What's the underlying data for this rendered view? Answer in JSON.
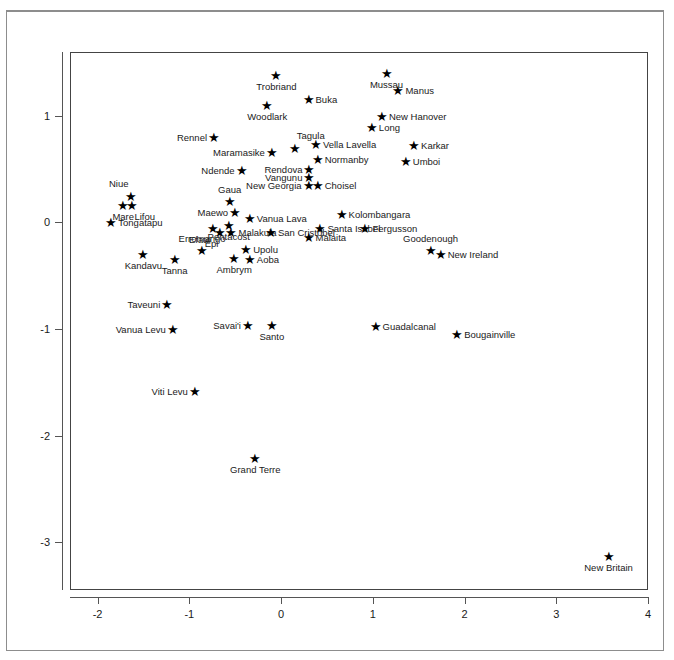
{
  "chart_data": {
    "type": "scatter",
    "title": "",
    "xlabel": "",
    "ylabel": "",
    "xlim": [
      -2.3,
      4.0
    ],
    "ylim": [
      -3.45,
      1.6
    ],
    "xticks": [
      "-2",
      "-1",
      "0",
      "1",
      "2",
      "3",
      "4"
    ],
    "xtick_values": [
      -2,
      -1,
      0,
      1,
      2,
      3,
      4
    ],
    "yticks": [
      "1",
      "0",
      "-1",
      "-2",
      "-3"
    ],
    "ytick_values": [
      1,
      0,
      -1,
      -2,
      -3
    ],
    "grid": false,
    "legend": false,
    "marker": "star",
    "marker_color": "#000000",
    "points": [
      {
        "label": "Trobriand",
        "x": -0.05,
        "y": 1.38,
        "pos": "below"
      },
      {
        "label": "Mussau",
        "x": 1.15,
        "y": 1.4,
        "pos": "below"
      },
      {
        "label": "Manus",
        "x": 1.28,
        "y": 1.24,
        "pos": "right"
      },
      {
        "label": "Woodlark",
        "x": -0.15,
        "y": 1.1,
        "pos": "below"
      },
      {
        "label": "Buka",
        "x": 0.3,
        "y": 1.16,
        "pos": "right"
      },
      {
        "label": "New Hanover",
        "x": 1.1,
        "y": 1.0,
        "pos": "right"
      },
      {
        "label": "Long",
        "x": 0.99,
        "y": 0.9,
        "pos": "right"
      },
      {
        "label": "Rennel",
        "x": -0.73,
        "y": 0.8,
        "pos": "left"
      },
      {
        "label": "Tagula",
        "x": 0.15,
        "y": 0.7,
        "pos": "abover"
      },
      {
        "label": "Vella Lavella",
        "x": 0.38,
        "y": 0.74,
        "pos": "right"
      },
      {
        "label": "Karkar",
        "x": 1.45,
        "y": 0.73,
        "pos": "right"
      },
      {
        "label": "Maramasike",
        "x": -0.1,
        "y": 0.66,
        "pos": "left"
      },
      {
        "label": "Normanby",
        "x": 0.4,
        "y": 0.6,
        "pos": "right"
      },
      {
        "label": "Umboi",
        "x": 1.36,
        "y": 0.58,
        "pos": "right"
      },
      {
        "label": "Ndende",
        "x": -0.43,
        "y": 0.49,
        "pos": "left"
      },
      {
        "label": "Rendova",
        "x": 0.31,
        "y": 0.5,
        "pos": "left"
      },
      {
        "label": "Vangunu",
        "x": 0.31,
        "y": 0.43,
        "pos": "left"
      },
      {
        "label": "New Georgia",
        "x": 0.3,
        "y": 0.35,
        "pos": "left"
      },
      {
        "label": "Choisel",
        "x": 0.4,
        "y": 0.35,
        "pos": "right"
      },
      {
        "label": "Niue",
        "x": -1.64,
        "y": 0.25,
        "pos": "abovel"
      },
      {
        "label": "Gaua",
        "x": -0.56,
        "y": 0.2,
        "pos": "above"
      },
      {
        "label": "Mare",
        "x": -1.72,
        "y": 0.16,
        "pos": "below"
      },
      {
        "label": "Lifou",
        "x": -1.62,
        "y": 0.16,
        "pos": "belowr"
      },
      {
        "label": "Maewo",
        "x": -0.5,
        "y": 0.1,
        "pos": "left"
      },
      {
        "label": "Vanua Lava",
        "x": -0.34,
        "y": 0.04,
        "pos": "right"
      },
      {
        "label": "Kolombangara",
        "x": 0.66,
        "y": 0.08,
        "pos": "right"
      },
      {
        "label": "Tongatapu",
        "x": -1.85,
        "y": 0.0,
        "pos": "right"
      },
      {
        "label": "Pentacost",
        "x": -0.57,
        "y": -0.02,
        "pos": "below"
      },
      {
        "label": "Santa Isabel",
        "x": 0.43,
        "y": -0.05,
        "pos": "right"
      },
      {
        "label": "Fergusson",
        "x": 0.92,
        "y": -0.05,
        "pos": "right"
      },
      {
        "label": "Efate",
        "x": -0.74,
        "y": -0.05,
        "pos": "belowl"
      },
      {
        "label": "Epi",
        "x": -0.66,
        "y": -0.09,
        "pos": "belowl"
      },
      {
        "label": "Malakula",
        "x": -0.54,
        "y": -0.09,
        "pos": "right"
      },
      {
        "label": "San Cristobel",
        "x": -0.11,
        "y": -0.09,
        "pos": "right"
      },
      {
        "label": "Malaita",
        "x": 0.3,
        "y": -0.14,
        "pos": "right"
      },
      {
        "label": "Goodenough",
        "x": 1.63,
        "y": -0.26,
        "pos": "above"
      },
      {
        "label": "New Ireland",
        "x": 1.74,
        "y": -0.3,
        "pos": "right"
      },
      {
        "label": "Erromango",
        "x": -0.86,
        "y": -0.26,
        "pos": "above"
      },
      {
        "label": "Upolu",
        "x": -0.38,
        "y": -0.25,
        "pos": "right"
      },
      {
        "label": "Aoba",
        "x": -0.34,
        "y": -0.34,
        "pos": "right"
      },
      {
        "label": "Kandavu",
        "x": -1.5,
        "y": -0.3,
        "pos": "below"
      },
      {
        "label": "Tanna",
        "x": -1.16,
        "y": -0.34,
        "pos": "below"
      },
      {
        "label": "Ambrym",
        "x": -0.51,
        "y": -0.33,
        "pos": "below"
      },
      {
        "label": "Taveuni",
        "x": -1.24,
        "y": -0.77,
        "pos": "left"
      },
      {
        "label": "Vanua Levu",
        "x": -1.18,
        "y": -1.0,
        "pos": "left"
      },
      {
        "label": "Savai'i",
        "x": -0.36,
        "y": -0.96,
        "pos": "left"
      },
      {
        "label": "Santo",
        "x": -0.1,
        "y": -0.96,
        "pos": "below"
      },
      {
        "label": "Guadalcanal",
        "x": 1.03,
        "y": -0.97,
        "pos": "right"
      },
      {
        "label": "Bougainville",
        "x": 1.92,
        "y": -1.05,
        "pos": "right"
      },
      {
        "label": "Viti Levu",
        "x": -0.94,
        "y": -1.58,
        "pos": "left"
      },
      {
        "label": "Grand Terre",
        "x": -0.28,
        "y": -2.21,
        "pos": "below"
      },
      {
        "label": "New Britain",
        "x": 3.57,
        "y": -3.13,
        "pos": "below"
      }
    ]
  }
}
